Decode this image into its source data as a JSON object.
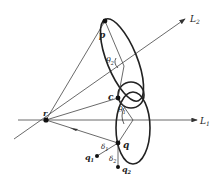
{
  "diagram": {
    "type": "geometric-construction",
    "lines": [
      {
        "id": "L1",
        "label": "L",
        "subscript": "1"
      },
      {
        "id": "L2",
        "label": "L",
        "subscript": "2"
      }
    ],
    "points": [
      {
        "id": "r",
        "label": "r"
      },
      {
        "id": "p",
        "label": "p"
      },
      {
        "id": "c",
        "label": "c"
      },
      {
        "id": "q",
        "label": "q"
      },
      {
        "id": "q1",
        "label": "q",
        "subscript": "1"
      },
      {
        "id": "q2",
        "label": "q",
        "subscript": "2"
      }
    ],
    "angles": [
      {
        "id": "theta2",
        "label": "θ",
        "subscript": "2"
      },
      {
        "id": "theta1",
        "label": "θ",
        "subscript": "1"
      }
    ],
    "distances": [
      {
        "id": "delta1",
        "label": "δ",
        "subscript": "1"
      },
      {
        "id": "delta2",
        "label": "δ",
        "subscript": "2"
      }
    ],
    "colors": {
      "stroke": "#333333",
      "thick": "#222222",
      "background": "#ffffff"
    }
  }
}
